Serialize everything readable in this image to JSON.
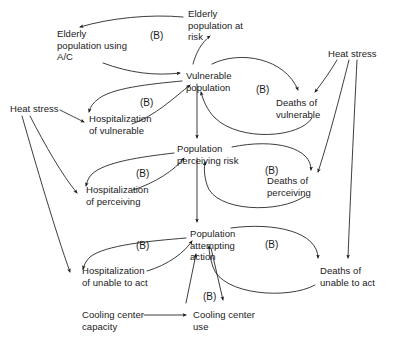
{
  "diagram": {
    "type": "causal-loop-diagram",
    "title": "",
    "width": 394,
    "height": 343,
    "background_color": "#ffffff",
    "line_color": "#1a1a1a",
    "text_color": "#1a1a1a",
    "nodes": [
      {
        "id": "elderly_ac",
        "label": "Elderly\npopulation using\nA/C",
        "x": 57,
        "y": 28
      },
      {
        "id": "elderly_risk",
        "label": "Elderly\npopulation at\nrisk",
        "x": 188,
        "y": 8
      },
      {
        "id": "heat_stress_right",
        "label": "Heat stress",
        "x": 328,
        "y": 48
      },
      {
        "id": "vulnerable_pop",
        "label": "Vulnerable\npopulation",
        "x": 186,
        "y": 70
      },
      {
        "id": "deaths_vulnerable",
        "label": "Deaths of\nvulnerable",
        "x": 276,
        "y": 97
      },
      {
        "id": "heat_stress_left",
        "label": "Heat stress",
        "x": 10,
        "y": 103
      },
      {
        "id": "hosp_vulnerable",
        "label": "Hospitalization\nof vulnerable",
        "x": 89,
        "y": 113
      },
      {
        "id": "pop_perceiving",
        "label": "Population\nperceiving risk",
        "x": 177,
        "y": 143
      },
      {
        "id": "deaths_perceiving",
        "label": "Deaths of\nperceiving",
        "x": 267,
        "y": 175
      },
      {
        "id": "hosp_perceiving",
        "label": "Hospitalization\nof perceiving",
        "x": 86,
        "y": 184
      },
      {
        "id": "pop_attempting",
        "label": "Population\nattempting\naction",
        "x": 190,
        "y": 228
      },
      {
        "id": "deaths_unable",
        "label": "Deaths of\nunable to act",
        "x": 320,
        "y": 265
      },
      {
        "id": "hosp_unable",
        "label": "Hospitalization\nof unable to act",
        "x": 82,
        "y": 265
      },
      {
        "id": "cooling_capacity",
        "label": "Cooling center\ncapacity",
        "x": 82,
        "y": 309
      },
      {
        "id": "cooling_use",
        "label": "Cooling center\nuse",
        "x": 193,
        "y": 309
      }
    ],
    "loop_labels": [
      {
        "id": "loop_b1",
        "label": "(B)",
        "x": 150,
        "y": 30
      },
      {
        "id": "loop_b2",
        "label": "(B)",
        "x": 256,
        "y": 84
      },
      {
        "id": "loop_b3",
        "label": "(B)",
        "x": 140,
        "y": 97
      },
      {
        "id": "loop_b4",
        "label": "(B)",
        "x": 136,
        "y": 168
      },
      {
        "id": "loop_b5",
        "label": "(B)",
        "x": 265,
        "y": 165
      },
      {
        "id": "loop_b6",
        "label": "(B)",
        "x": 136,
        "y": 240
      },
      {
        "id": "loop_b7",
        "label": "(B)",
        "x": 265,
        "y": 239
      },
      {
        "id": "loop_b8",
        "label": "(B)",
        "x": 203,
        "y": 291
      }
    ],
    "edges": [
      {
        "id": "e1",
        "from": "elderly_risk",
        "to": "elderly_ac",
        "polarity": "balancing"
      },
      {
        "id": "e2",
        "from": "elderly_ac",
        "to": "vulnerable_pop",
        "polarity": "balancing"
      },
      {
        "id": "e3",
        "from": "vulnerable_pop",
        "to": "elderly_risk",
        "polarity": "balancing"
      },
      {
        "id": "e4",
        "from": "vulnerable_pop",
        "to": "deaths_vulnerable",
        "polarity": "balancing"
      },
      {
        "id": "e5",
        "from": "deaths_vulnerable",
        "to": "vulnerable_pop",
        "polarity": "balancing"
      },
      {
        "id": "e6",
        "from": "vulnerable_pop",
        "to": "hosp_vulnerable",
        "polarity": "balancing"
      },
      {
        "id": "e7",
        "from": "hosp_vulnerable",
        "to": "vulnerable_pop",
        "polarity": "balancing"
      },
      {
        "id": "e8",
        "from": "heat_stress_left",
        "to": "hosp_vulnerable",
        "polarity": "positive"
      },
      {
        "id": "e9",
        "from": "heat_stress_left",
        "to": "hosp_perceiving",
        "polarity": "positive"
      },
      {
        "id": "e10",
        "from": "heat_stress_left",
        "to": "hosp_unable",
        "polarity": "positive"
      },
      {
        "id": "e11",
        "from": "heat_stress_right",
        "to": "deaths_vulnerable",
        "polarity": "positive"
      },
      {
        "id": "e12",
        "from": "heat_stress_right",
        "to": "deaths_perceiving",
        "polarity": "positive"
      },
      {
        "id": "e13",
        "from": "heat_stress_right",
        "to": "deaths_unable",
        "polarity": "positive"
      },
      {
        "id": "e14",
        "from": "vulnerable_pop",
        "to": "pop_perceiving",
        "polarity": "positive"
      },
      {
        "id": "e15",
        "from": "pop_perceiving",
        "to": "deaths_perceiving",
        "polarity": "balancing"
      },
      {
        "id": "e16",
        "from": "deaths_perceiving",
        "to": "pop_perceiving",
        "polarity": "balancing"
      },
      {
        "id": "e17",
        "from": "pop_perceiving",
        "to": "hosp_perceiving",
        "polarity": "balancing"
      },
      {
        "id": "e18",
        "from": "hosp_perceiving",
        "to": "pop_perceiving",
        "polarity": "balancing"
      },
      {
        "id": "e19",
        "from": "pop_perceiving",
        "to": "pop_attempting",
        "polarity": "positive"
      },
      {
        "id": "e20",
        "from": "pop_attempting",
        "to": "deaths_unable",
        "polarity": "balancing"
      },
      {
        "id": "e21",
        "from": "deaths_unable",
        "to": "pop_attempting",
        "polarity": "balancing"
      },
      {
        "id": "e22",
        "from": "pop_attempting",
        "to": "hosp_unable",
        "polarity": "balancing"
      },
      {
        "id": "e23",
        "from": "hosp_unable",
        "to": "pop_attempting",
        "polarity": "balancing"
      },
      {
        "id": "e24",
        "from": "cooling_capacity",
        "to": "cooling_use",
        "polarity": "positive"
      },
      {
        "id": "e25",
        "from": "cooling_use",
        "to": "pop_attempting",
        "polarity": "balancing"
      },
      {
        "id": "e26",
        "from": "pop_attempting",
        "to": "cooling_use",
        "polarity": "balancing"
      }
    ]
  }
}
